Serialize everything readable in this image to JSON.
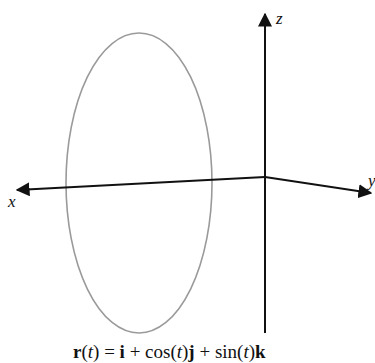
{
  "figure": {
    "axes": {
      "x": {
        "label": "x"
      },
      "y": {
        "label": "y"
      },
      "z": {
        "label": "z"
      }
    },
    "curve": {
      "shape": "ellipse",
      "description": "circle of radius 1 in the plane x = 1",
      "stroke_color": "#9a9a9a"
    },
    "axis_color": "#111111",
    "caption": {
      "r": "r",
      "open1": "(",
      "t1": "t",
      "close1": ")",
      "eq": " = ",
      "i": "i",
      "plus1": " + cos(",
      "t2": "t",
      "close2": ")",
      "j": "j",
      "plus2": " + sin(",
      "t3": "t",
      "close3": ")",
      "k": "k",
      "full_text": "r(t) = i + cos(t)j + sin(t)k"
    }
  }
}
